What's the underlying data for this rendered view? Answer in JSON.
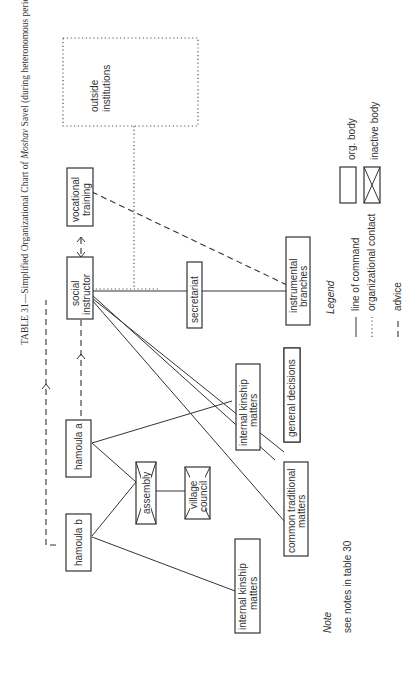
{
  "title": {
    "prefix": "TABLE 31—Simplified Organizational Chart of ",
    "italic": "Moshav",
    "suffix": " Savel (during heteronomous period)"
  },
  "nodes": {
    "outside_institutions": [
      "outside",
      "institutions"
    ],
    "vocational_training": [
      "vocational",
      "training"
    ],
    "social_instructor": [
      "social",
      "instructor"
    ],
    "secretariat": [
      "secretariat"
    ],
    "instrumental_branches": [
      "instrumental",
      "branches"
    ],
    "general_decisions": [
      "general  decisions"
    ],
    "internal_kinship_matters_a": [
      "internal  kinship",
      "matters"
    ],
    "hamoula_a": [
      "hamoula a"
    ],
    "hamoula_b": [
      "hamoula b"
    ],
    "assembly": [
      "assembly"
    ],
    "village_council": [
      "village",
      "council"
    ],
    "common_traditional_matters": [
      "common traditional",
      "matters"
    ],
    "internal_kinship_matters_b": [
      "internal  kinship",
      "matters"
    ]
  },
  "legend": {
    "title": "Legend",
    "items": [
      {
        "key": "org_body",
        "label": "org. body"
      },
      {
        "key": "inactive_body",
        "label": "inactive body"
      },
      {
        "key": "line_of_command",
        "label": "line of command"
      },
      {
        "key": "organizational_contact",
        "label": "organizational contact"
      },
      {
        "key": "advice",
        "label": "advice"
      }
    ]
  },
  "note": {
    "title": "Note",
    "text": "see notes in table 30"
  }
}
